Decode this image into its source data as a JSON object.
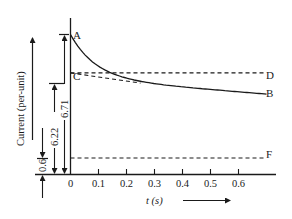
{
  "chart_data": {
    "type": "line",
    "title": "",
    "xlabel": "t (s)",
    "ylabel": "Current (per-unit)",
    "xlim": [
      0,
      0.7
    ],
    "x_ticks": [
      "0",
      "0.1",
      "0.2",
      "0.3",
      "0.4",
      "0.5",
      "0.6"
    ],
    "x_tick_values": [
      0,
      0.1,
      0.2,
      0.3,
      0.4,
      0.5,
      0.6
    ],
    "grid": false,
    "series": [
      {
        "name": "AB",
        "style": "solid",
        "description": "Decaying current from subtransient (A) towards transient envelope (B)",
        "x": [
          0,
          0.02,
          0.05,
          0.08,
          0.1,
          0.15,
          0.2,
          0.25,
          0.3,
          0.4,
          0.5,
          0.6,
          0.7
        ],
        "y": [
          6.71,
          6.55,
          6.42,
          6.32,
          6.26,
          6.17,
          6.12,
          6.09,
          6.07,
          6.04,
          6.01,
          5.98,
          5.95
        ]
      },
      {
        "name": "CD",
        "style": "dashed",
        "x": [
          0,
          0.7
        ],
        "y": [
          6.22,
          6.22
        ]
      },
      {
        "name": "CB",
        "style": "dashed",
        "x": [
          0,
          0.25
        ],
        "y": [
          6.22,
          6.09
        ]
      },
      {
        "name": "F",
        "style": "dashed",
        "x": [
          0,
          0.7
        ],
        "y": [
          0.6,
          0.6
        ]
      }
    ],
    "point_labels": [
      {
        "label": "A",
        "x": 0,
        "y": 6.71
      },
      {
        "label": "C",
        "x": 0,
        "y": 6.22
      },
      {
        "label": "D",
        "x": 0.7,
        "y": 6.22
      },
      {
        "label": "B",
        "x": 0.7,
        "y": 5.95
      },
      {
        "label": "F",
        "x": 0.7,
        "y": 0.6
      }
    ],
    "dimensions": [
      {
        "label": "6.71",
        "from": 0,
        "to": 6.71
      },
      {
        "label": "6.22",
        "from": 0,
        "to": 6.22
      },
      {
        "label": "0.6",
        "from": 0,
        "to": 0.6
      }
    ]
  },
  "labels": {
    "A": "A",
    "B": "B",
    "C": "C",
    "D": "D",
    "F": "F",
    "ylabel": "Current (per-unit)",
    "xlabel": "t (s)",
    "dim_671": "6.71",
    "dim_622": "6.22",
    "dim_06": "0.6"
  }
}
